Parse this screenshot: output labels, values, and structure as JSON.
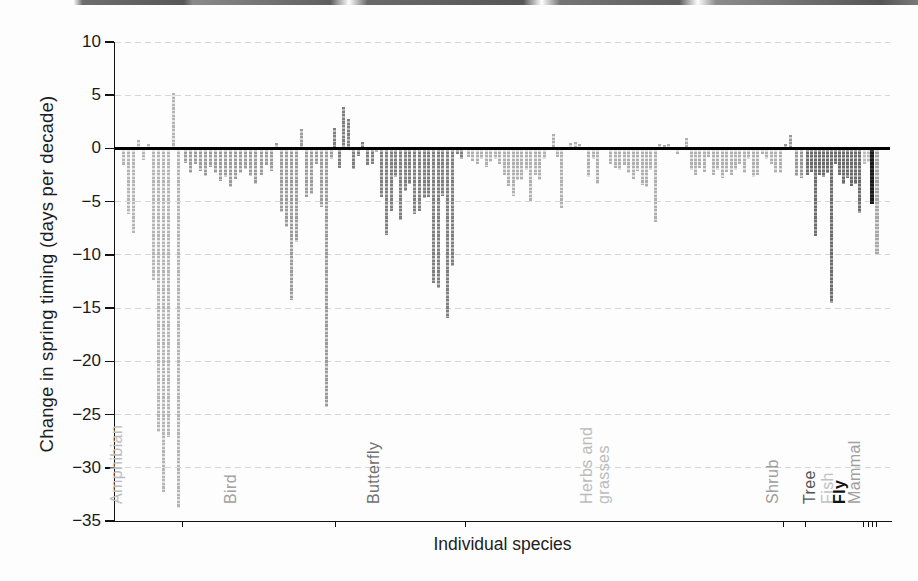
{
  "axes": {
    "ylabel": "Change in spring timing (days per decade)",
    "xlabel": "Individual species"
  },
  "chart_data": {
    "type": "bar",
    "title": "",
    "xlabel": "Individual species",
    "ylabel": "Change in spring timing (days per decade)",
    "ylim": [
      -35,
      10
    ],
    "yticks": [
      10,
      5,
      0,
      -5,
      -10,
      -15,
      -20,
      -25,
      -30,
      -35
    ],
    "ytick_labels": [
      "10",
      "5",
      "0",
      "−5",
      "−10",
      "−15",
      "−20",
      "−25",
      "−30",
      "−35"
    ],
    "grid": {
      "horizontal": true,
      "style": "dashed",
      "color": "#d6d6d6",
      "zero_line_color": "#000000"
    },
    "legend": "none",
    "group_dividers_x": [
      182,
      335,
      465,
      783,
      805,
      863,
      868,
      872,
      876
    ],
    "groups": [
      {
        "name": "Amphibian",
        "label_lines": [
          "Amphibian"
        ],
        "label_color": "#bcbcbc",
        "color": "#b5b5b5",
        "hatch": "#e2e2e2",
        "x_start": 122,
        "x_end": 182,
        "label_x": 133,
        "values": [
          -1.6,
          -6.2,
          -7.9,
          0.8,
          -1.1,
          0.4,
          -12.4,
          -26.6,
          -32.3,
          -27.1,
          5.2,
          -33.8
        ]
      },
      {
        "name": "Bird",
        "label_lines": [
          "Bird"
        ],
        "label_color": "#a2a2a2",
        "color": "#9b9b9b",
        "hatch": "#d2d2d2",
        "x_start": 184,
        "x_end": 335,
        "label_x": 247,
        "values": [
          -1.4,
          -2.3,
          -1.5,
          -2.1,
          -2.6,
          -1.7,
          -2.3,
          -3.1,
          -2.7,
          -3.6,
          -2.9,
          -2.3,
          -1.9,
          -2.6,
          -3.3,
          -2.5,
          -1.6,
          -2.1,
          0.5,
          -6.0,
          -7.4,
          -14.2,
          -8.8,
          1.8,
          -4.6,
          -4.3,
          -1.5,
          -5.5,
          -24.3,
          -1.0
        ]
      },
      {
        "name": "Butterfly",
        "label_lines": [
          "Butterfly"
        ],
        "label_color": "#6f6f6f",
        "color": "#7f7f7f",
        "hatch": "#bababa",
        "x_start": 333,
        "x_end": 465,
        "label_x": 390,
        "values": [
          1.9,
          -1.8,
          3.9,
          2.8,
          -1.9,
          -0.7,
          0.6,
          -1.6,
          -1.5,
          -0.3,
          -4.6,
          -8.1,
          -5.9,
          -2.7,
          -6.7,
          -4.0,
          -3.3,
          -6.2,
          -5.9,
          -4.7,
          -4.6,
          -12.6,
          -13.1,
          -4.5,
          -15.9,
          -11.0,
          -0.5,
          -1.0
        ]
      },
      {
        "name": "Herbs and grasses",
        "label_lines": [
          "Herbs and",
          "grasses"
        ],
        "label_color": "#bcbcbc",
        "color": "#b0b0b0",
        "hatch": "#dedede",
        "x_start": 467,
        "x_end": 783,
        "label_x": 629,
        "values": [
          -0.8,
          -1.2,
          -1.5,
          -1.0,
          -1.7,
          -1.3,
          -1.0,
          -1.5,
          -2.5,
          -3.5,
          -4.5,
          -3.0,
          -3.0,
          -2.0,
          -5.0,
          -2.5,
          -3.0,
          -1.0,
          null,
          1.4,
          -0.8,
          -5.6,
          null,
          0.5,
          0.6,
          0.4,
          null,
          -2.7,
          -1.0,
          -3.3,
          null,
          null,
          -1.5,
          -1.8,
          -2.0,
          -1.6,
          -2.3,
          -2.9,
          -2.1,
          -3.4,
          -3.6,
          -2.0,
          -6.9,
          0.4,
          0.3,
          0.4,
          null,
          -0.5,
          null,
          1.0,
          -2.0,
          -2.5,
          -1.8,
          -2.2,
          -0.8,
          -2.5,
          -2.0,
          -2.8,
          -2.2,
          -2.5,
          -2.0,
          -1.5,
          -2.3,
          -1.0,
          -2.7,
          -2.5,
          -0.5,
          -1.0,
          -1.5,
          -2.3,
          -2.3
        ]
      },
      {
        "name": "Shrub",
        "label_lines": [
          "Shrub"
        ],
        "label_color": "#9e9e9e",
        "color": "#989898",
        "hatch": "#cecece",
        "x_start": 784,
        "x_end": 805,
        "label_x": 789,
        "values": [
          0.4,
          1.3,
          -2.6,
          -2.8
        ]
      },
      {
        "name": "Tree",
        "label_lines": [
          "Tree"
        ],
        "label_color": "#555555",
        "color": "#6c6c6c",
        "hatch": "#a6a6a6",
        "x_start": 806,
        "x_end": 862,
        "label_x": 826,
        "values": [
          -2.5,
          -2.2,
          -8.2,
          -2.5,
          -2.7,
          -2.3,
          -14.5,
          -1.5,
          -2.5,
          -3.3,
          -2.8,
          -3.5,
          -3.3,
          -6.1
        ]
      },
      {
        "name": "Fish",
        "label_lines": [
          "Fish"
        ],
        "label_color": "#c2c2c2",
        "color": "#bdbdbd",
        "hatch": "#e3e3e3",
        "x_start": 863,
        "x_end": 870,
        "label_x": 844,
        "values": [
          -1.5,
          -1.3
        ]
      },
      {
        "name": "Fly",
        "label_lines": [
          "Fly"
        ],
        "label_color": "#111111",
        "bold": true,
        "color": "#1b1b1b",
        "hatch": "#3a3a3a",
        "x_start": 870,
        "x_end": 874,
        "label_x": 856,
        "bar_width": 4,
        "values": [
          -5.2
        ]
      },
      {
        "name": "Mammal",
        "label_lines": [
          "Mammal"
        ],
        "label_color": "#a0a0a0",
        "color": "#a8a8a8",
        "hatch": "#d8d8d8",
        "x_start": 875,
        "x_end": 884,
        "label_x": 871,
        "bar_width": 4,
        "values": [
          -9.9
        ]
      }
    ]
  }
}
